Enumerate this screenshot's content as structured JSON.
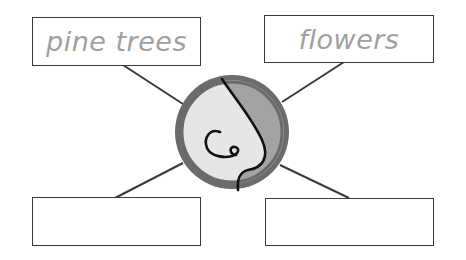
{
  "diagram": {
    "type": "sense-web",
    "center": {
      "icon": "nose-icon",
      "sense": "smell"
    },
    "boxes": [
      {
        "position": "top-left",
        "label": "pine trees"
      },
      {
        "position": "top-right",
        "label": "flowers"
      },
      {
        "position": "bottom-left",
        "label": ""
      },
      {
        "position": "bottom-right",
        "label": ""
      }
    ]
  },
  "colors": {
    "ring": "#6b6b6b",
    "inner_light": "#e6e6e6",
    "inner_dark": "#a3a3a3",
    "line": "#3a3a3a",
    "label_text": "#a0a0a0"
  }
}
